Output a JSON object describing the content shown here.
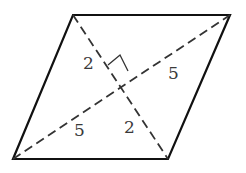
{
  "diagram": {
    "type": "rhombus-with-diagonals",
    "vertices": {
      "top_left": [
        73,
        15
      ],
      "top_right": [
        230,
        15
      ],
      "bottom_right": [
        168,
        159
      ],
      "bottom_left": [
        13,
        159
      ]
    },
    "intersection": [
      119,
      87
    ],
    "right_angle_marker": true,
    "labels": {
      "short_diag_upper": "2",
      "long_diag_right": "5",
      "long_diag_left": "5",
      "short_diag_lower": "2"
    },
    "colors": {
      "stroke": "#111111",
      "dash": "#333333",
      "label": "#3a3a3a"
    }
  }
}
